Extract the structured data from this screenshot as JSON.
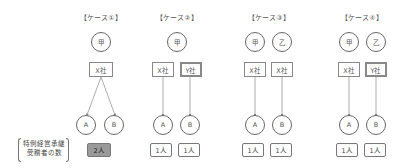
{
  "row_label": {
    "line1": "特例経営承継",
    "line2": "受贈者の数"
  },
  "cases": [
    {
      "title": "【ケース①】",
      "donors": [
        "甲"
      ],
      "companies": [
        {
          "name": "X社",
          "bold": false
        }
      ],
      "recipients": [
        "A",
        "B"
      ],
      "counts": [
        {
          "value": "2人",
          "highlight": true
        }
      ]
    },
    {
      "title": "【ケース②】",
      "donors": [
        "甲"
      ],
      "companies": [
        {
          "name": "X社",
          "bold": false
        },
        {
          "name": "Y社",
          "bold": true
        }
      ],
      "recipients": [
        "A",
        "B"
      ],
      "counts": [
        {
          "value": "1人",
          "highlight": false
        },
        {
          "value": "1人",
          "highlight": false
        }
      ]
    },
    {
      "title": "【ケース③】",
      "donors": [
        "甲",
        "乙"
      ],
      "companies": [
        {
          "name": "X社",
          "bold": false
        },
        {
          "name": "X社",
          "bold": false
        }
      ],
      "recipients": [
        "A",
        "B"
      ],
      "counts": [
        {
          "value": "1人",
          "highlight": false
        },
        {
          "value": "1人",
          "highlight": false
        }
      ]
    },
    {
      "title": "【ケース④】",
      "donors": [
        "甲",
        "乙"
      ],
      "companies": [
        {
          "name": "X社",
          "bold": false
        },
        {
          "name": "Y社",
          "bold": true
        }
      ],
      "recipients": [
        "A",
        "B"
      ],
      "counts": [
        {
          "value": "1人",
          "highlight": false
        },
        {
          "value": "1人",
          "highlight": false
        }
      ]
    }
  ],
  "colors": {
    "line": "#777777",
    "highlight_fill": "#9a9a9a"
  }
}
